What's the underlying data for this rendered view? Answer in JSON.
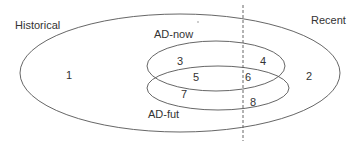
{
  "diagram": {
    "type": "venn",
    "sets": {
      "historical": {
        "label": "Historical"
      },
      "recent": {
        "label": "Recent"
      },
      "ad_now": {
        "label": "AD-now"
      },
      "ad_fut": {
        "label": "AD-fut"
      }
    },
    "regions": [
      {
        "id": "r1",
        "label": "1"
      },
      {
        "id": "r2",
        "label": "2"
      },
      {
        "id": "r3",
        "label": "3"
      },
      {
        "id": "r4",
        "label": "4"
      },
      {
        "id": "r5",
        "label": "5"
      },
      {
        "id": "r6",
        "label": "6"
      },
      {
        "id": "r7",
        "label": "7"
      },
      {
        "id": "r8",
        "label": "8"
      }
    ],
    "colors": {
      "stroke": "#555555",
      "text": "#333333",
      "background": "#ffffff"
    }
  }
}
